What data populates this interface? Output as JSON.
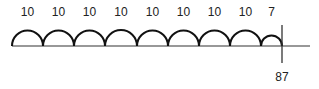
{
  "diagram": {
    "type": "open-number-line",
    "jumps": [
      {
        "label": "10",
        "x_start": 12,
        "x_end": 43
      },
      {
        "label": "10",
        "x_start": 43,
        "x_end": 74
      },
      {
        "label": "10",
        "x_start": 74,
        "x_end": 105
      },
      {
        "label": "10",
        "x_start": 105,
        "x_end": 137
      },
      {
        "label": "10",
        "x_start": 137,
        "x_end": 168
      },
      {
        "label": "10",
        "x_start": 168,
        "x_end": 199
      },
      {
        "label": "10",
        "x_start": 199,
        "x_end": 230
      },
      {
        "label": "10",
        "x_start": 230,
        "x_end": 261
      },
      {
        "label": "7",
        "x_start": 261,
        "x_end": 282
      }
    ],
    "end_marker": {
      "label": "87",
      "x": 282
    },
    "line": {
      "x_start": 12,
      "x_end": 310,
      "y": 46
    },
    "colors": {
      "stroke": "#111111",
      "tick": "#333333",
      "text": "#222222"
    }
  }
}
